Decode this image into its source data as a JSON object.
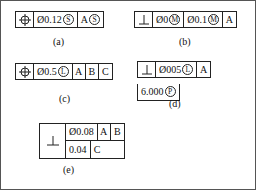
{
  "figures": [
    {
      "id": "a",
      "caption": "(a)",
      "symbol": "position-symbol",
      "cells": [
        {
          "type": "tolerance",
          "diameter": "Ø",
          "value": "0.12",
          "modifier": "S"
        },
        {
          "type": "datum",
          "letter": "A",
          "modifier": "S"
        }
      ]
    },
    {
      "id": "b",
      "caption": "(b)",
      "symbol": "perpendicularity-symbol",
      "cells": [
        {
          "type": "tolerance",
          "diameter": "Ø",
          "value": "0",
          "modifier": "M"
        },
        {
          "type": "tolerance",
          "diameter": "Ø",
          "value": "0.1",
          "modifier": "M"
        },
        {
          "type": "datum",
          "letter": "A",
          "modifier": ""
        }
      ]
    },
    {
      "id": "c",
      "caption": "(c)",
      "symbol": "position-symbol",
      "cells": [
        {
          "type": "tolerance",
          "diameter": "Ø",
          "value": "0.5",
          "modifier": "L"
        },
        {
          "type": "datum",
          "letter": "A",
          "modifier": ""
        },
        {
          "type": "datum",
          "letter": "B",
          "modifier": ""
        },
        {
          "type": "datum",
          "letter": "C",
          "modifier": ""
        }
      ]
    },
    {
      "id": "d",
      "caption": "(d)",
      "symbol": "perpendicularity-symbol",
      "cells": [
        {
          "type": "tolerance",
          "diameter": "Ø",
          "value": "005",
          "modifier": "L"
        },
        {
          "type": "datum",
          "letter": "A",
          "modifier": ""
        }
      ],
      "projected_zone": {
        "value": "6.000",
        "modifier": "P"
      }
    },
    {
      "id": "e",
      "caption": "(e)",
      "symbol": "perpendicularity-symbol",
      "rows": [
        {
          "cells": [
            {
              "type": "tolerance",
              "diameter": "Ø",
              "value": "0.08",
              "modifier": ""
            },
            {
              "type": "datum",
              "letter": "A",
              "modifier": ""
            },
            {
              "type": "datum",
              "letter": "B",
              "modifier": ""
            }
          ]
        },
        {
          "cells": [
            {
              "type": "tolerance",
              "diameter": "",
              "value": "0.04",
              "modifier": ""
            },
            {
              "type": "datum",
              "letter": "C",
              "modifier": ""
            }
          ]
        }
      ]
    }
  ],
  "colors": {
    "line": "#222222",
    "border": "#555555",
    "background": "#ffffff"
  }
}
